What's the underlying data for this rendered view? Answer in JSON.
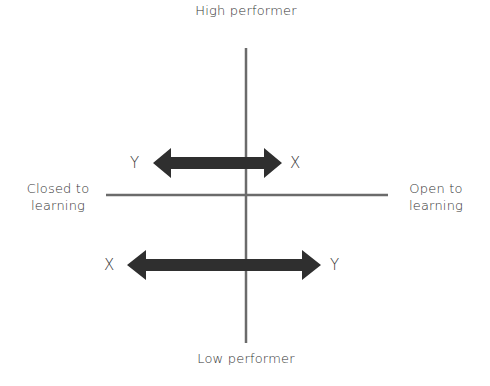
{
  "diagram": {
    "type": "quadrant",
    "axes": {
      "vertical": {
        "top_label": "High performer",
        "bottom_label": "Low performer"
      },
      "horizontal": {
        "left_label": "Closed to\nlearning",
        "right_label": "Open to\nlearning"
      }
    },
    "arrows": [
      {
        "position": "upper",
        "direction": "bidirectional",
        "left_label": "Y",
        "right_label": "X"
      },
      {
        "position": "lower",
        "direction": "bidirectional",
        "left_label": "X",
        "right_label": "Y"
      }
    ],
    "colors": {
      "axis_line": "#6b6b6b",
      "arrow_fill": "#2f2f2f",
      "text": "#333333",
      "background": "#ffffff"
    }
  }
}
